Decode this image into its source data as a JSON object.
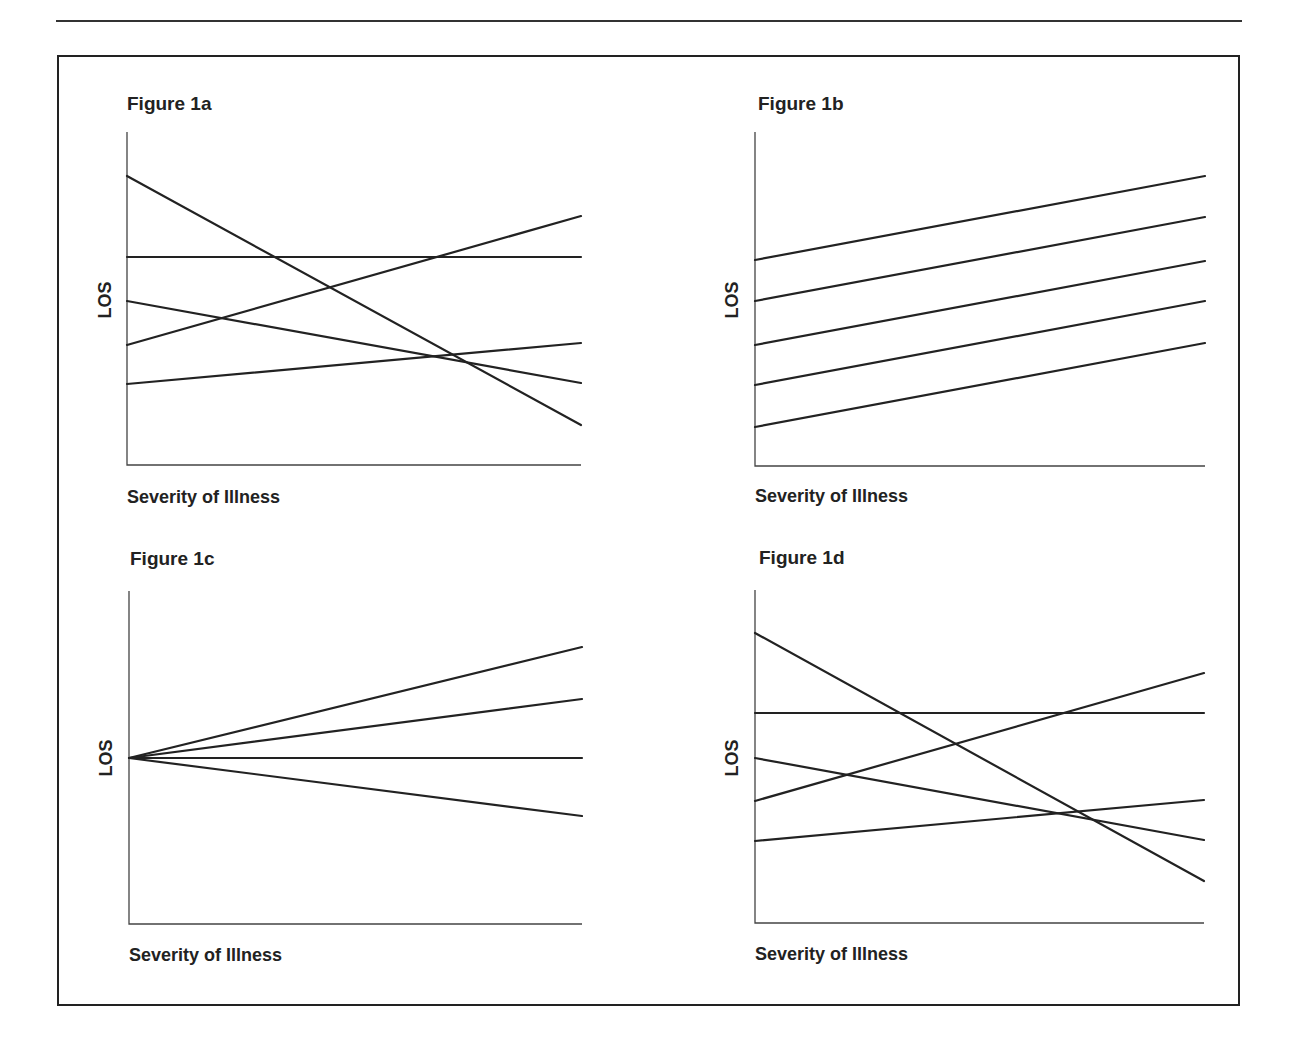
{
  "chart_data": [
    {
      "id": "1a",
      "type": "line",
      "title": "Figure 1a",
      "xlabel": "Severity of Illness",
      "ylabel": "LOS",
      "grid": false,
      "legend": null,
      "frame": {
        "x0": 127,
        "x1": 581,
        "ytop": 132,
        "ybottom": 465
      },
      "series": [
        {
          "name": "line 1",
          "y_start": 176,
          "y_end": 425
        },
        {
          "name": "line 2",
          "y_start": 257,
          "y_end": 257
        },
        {
          "name": "line 3",
          "y_start": 301,
          "y_end": 383
        },
        {
          "name": "line 4",
          "y_start": 345,
          "y_end": 216
        },
        {
          "name": "line 5",
          "y_start": 384,
          "y_end": 343
        }
      ]
    },
    {
      "id": "1b",
      "type": "line",
      "title": "Figure 1b",
      "xlabel": "Severity of Illness",
      "ylabel": "LOS",
      "grid": false,
      "legend": null,
      "frame": {
        "x0": 755,
        "x1": 1205,
        "ytop": 132,
        "ybottom": 466
      },
      "series": [
        {
          "name": "line 1",
          "y_start": 260,
          "y_end": 176
        },
        {
          "name": "line 2",
          "y_start": 301,
          "y_end": 217
        },
        {
          "name": "line 3",
          "y_start": 345,
          "y_end": 261
        },
        {
          "name": "line 4",
          "y_start": 385,
          "y_end": 301
        },
        {
          "name": "line 5",
          "y_start": 427,
          "y_end": 343
        }
      ]
    },
    {
      "id": "1c",
      "type": "line",
      "title": "Figure 1c",
      "xlabel": "Severity of Illness",
      "ylabel": "LOS",
      "grid": false,
      "legend": null,
      "frame": {
        "x0": 129,
        "x1": 582,
        "ytop": 591,
        "ybottom": 924
      },
      "series": [
        {
          "name": "line 1",
          "y_start": 758,
          "y_end": 647
        },
        {
          "name": "line 2",
          "y_start": 758,
          "y_end": 699
        },
        {
          "name": "line 3",
          "y_start": 758,
          "y_end": 758
        },
        {
          "name": "line 4",
          "y_start": 758,
          "y_end": 816
        }
      ]
    },
    {
      "id": "1d",
      "type": "line",
      "title": "Figure 1d",
      "xlabel": "Severity of Illness",
      "ylabel": "LOS",
      "grid": false,
      "legend": null,
      "frame": {
        "x0": 755,
        "x1": 1204,
        "ytop": 590,
        "ybottom": 923
      },
      "series": [
        {
          "name": "line 1",
          "y_start": 633,
          "y_end": 881
        },
        {
          "name": "line 2",
          "y_start": 713,
          "y_end": 713
        },
        {
          "name": "line 3",
          "y_start": 758,
          "y_end": 840
        },
        {
          "name": "line 4",
          "y_start": 801,
          "y_end": 673
        },
        {
          "name": "line 5",
          "y_start": 841,
          "y_end": 800
        }
      ]
    }
  ],
  "panels": [
    {
      "title": "Figure 1a",
      "xlabel": "Severity of Illness",
      "ylabel": "LOS"
    },
    {
      "title": "Figure 1b",
      "xlabel": "Severity of Illness",
      "ylabel": "LOS"
    },
    {
      "title": "Figure 1c",
      "xlabel": "Severity of Illness",
      "ylabel": "LOS"
    },
    {
      "title": "Figure 1d",
      "xlabel": "Severity of Illness",
      "ylabel": "LOS"
    }
  ]
}
